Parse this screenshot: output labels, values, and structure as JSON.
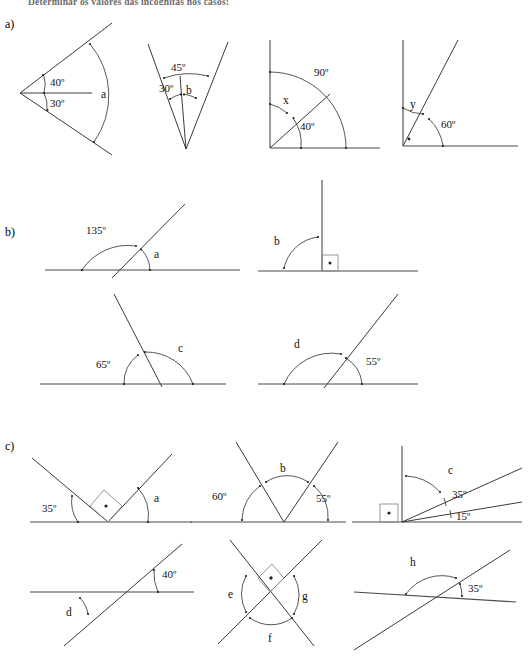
{
  "page": {
    "header_text": "Determinar os valores das incógnitas nos casos:",
    "width": 529,
    "height": 661,
    "background": "#ffffff",
    "ink_color": "#3a3a3a"
  },
  "sections": [
    {
      "id": "a",
      "label": "a)"
    },
    {
      "id": "b",
      "label": "b)"
    },
    {
      "id": "c",
      "label": "c)"
    }
  ],
  "figures": {
    "a1": {
      "name": "two-adjacent-angles-at-left-vertex",
      "labels": {
        "upper": "40º",
        "lower": "30º",
        "unknown": "a"
      }
    },
    "a2": {
      "name": "nested-angles-at-bottom-vertex",
      "labels": {
        "outer": "45º",
        "inner": "30º",
        "unknown": "b"
      }
    },
    "a3": {
      "name": "right-angle-split-by-ray",
      "labels": {
        "total": "90º",
        "unknown": "x",
        "known": "40º"
      }
    },
    "a4": {
      "name": "right-angle-with-60-degree-ray",
      "labels": {
        "unknown": "y",
        "known": "60º",
        "right_angle_mark": "•"
      }
    },
    "b1": {
      "name": "linear-pair-135",
      "labels": {
        "known": "135º",
        "unknown": "a"
      }
    },
    "b2": {
      "name": "perpendicular-line-right-angle",
      "labels": {
        "unknown": "b",
        "right_angle_mark": "•"
      }
    },
    "b3": {
      "name": "linear-pair-65",
      "labels": {
        "known": "65º",
        "unknown": "c"
      }
    },
    "b4": {
      "name": "linear-pair-55",
      "labels": {
        "unknown": "d",
        "known": "55º"
      }
    },
    "c1": {
      "name": "two-rays-with-right-angle-between",
      "labels": {
        "known": "35º",
        "unknown": "a",
        "right_angle_mark": "•"
      }
    },
    "c2": {
      "name": "v-shape-on-line",
      "labels": {
        "left": "60º",
        "unknown": "b",
        "right": "55º"
      }
    },
    "c3": {
      "name": "vertical-with-two-rays",
      "labels": {
        "unknown": "c",
        "upper": "35º",
        "lower": "15º",
        "right_angle_mark": "•"
      }
    },
    "c4": {
      "name": "transversal-crossing-40",
      "labels": {
        "known": "40º",
        "unknown": "d"
      }
    },
    "c5": {
      "name": "perpendicular-crossing-lines",
      "labels": {
        "left": "e",
        "bottom": "f",
        "right": "g",
        "right_angle_mark": "•"
      }
    },
    "c6": {
      "name": "crossing-lines-35",
      "labels": {
        "unknown": "h",
        "known": "35º"
      }
    }
  }
}
